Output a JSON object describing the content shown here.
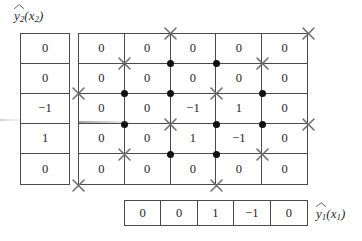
{
  "figure": {
    "type": "lattice-grid-diagram",
    "background_color": "#ffffff",
    "line_color": "#4a4a4a",
    "dot_color": "#111111",
    "cross_color": "#6b6b6b"
  },
  "labels": {
    "y2": {
      "base": "y",
      "sub": "2",
      "arg_open": "(",
      "arg_base": "x",
      "arg_sub": "2",
      "arg_close": ")",
      "full": "y2(x2)"
    },
    "y1": {
      "base": "y",
      "sub": "1",
      "arg_open": "(",
      "arg_base": "x",
      "arg_sub": "1",
      "arg_close": ")",
      "full": "y1(x1)"
    }
  },
  "left_column": {
    "name": "y2-values",
    "values": [
      "0",
      "0",
      "−1",
      "1",
      "0"
    ]
  },
  "bottom_row": {
    "name": "y1-values",
    "values": [
      "0",
      "0",
      "1",
      "−1",
      "0"
    ]
  },
  "grid": {
    "rows": 5,
    "cols": 5,
    "values": [
      [
        "0",
        "0",
        "0",
        "0",
        "0"
      ],
      [
        "0",
        "0",
        "0",
        "0",
        "0"
      ],
      [
        "0",
        "0",
        "−1",
        "1",
        "0"
      ],
      [
        "0",
        "0",
        "1",
        "−1",
        "0"
      ],
      [
        "0",
        "0",
        "0",
        "0",
        "0"
      ]
    ]
  },
  "markers": {
    "legend": {
      "dot": "●",
      "cross": "✕"
    },
    "points": [
      {
        "row": 0,
        "col": 2,
        "kind": "cross"
      },
      {
        "row": 0,
        "col": 5,
        "kind": "cross"
      },
      {
        "row": 1,
        "col": 1,
        "kind": "cross"
      },
      {
        "row": 1,
        "col": 2,
        "kind": "dot"
      },
      {
        "row": 1,
        "col": 3,
        "kind": "dot"
      },
      {
        "row": 1,
        "col": 4,
        "kind": "cross"
      },
      {
        "row": 2,
        "col": 0,
        "kind": "cross"
      },
      {
        "row": 2,
        "col": 1,
        "kind": "dot"
      },
      {
        "row": 2,
        "col": 2,
        "kind": "dot"
      },
      {
        "row": 2,
        "col": 3,
        "kind": "cross"
      },
      {
        "row": 2,
        "col": 4,
        "kind": "dot"
      },
      {
        "row": 3,
        "col": 1,
        "kind": "dot"
      },
      {
        "row": 3,
        "col": 2,
        "kind": "cross"
      },
      {
        "row": 3,
        "col": 3,
        "kind": "dot"
      },
      {
        "row": 3,
        "col": 4,
        "kind": "dot"
      },
      {
        "row": 3,
        "col": 5,
        "kind": "cross"
      },
      {
        "row": 4,
        "col": 1,
        "kind": "cross"
      },
      {
        "row": 4,
        "col": 2,
        "kind": "dot"
      },
      {
        "row": 4,
        "col": 3,
        "kind": "dot"
      },
      {
        "row": 4,
        "col": 4,
        "kind": "cross"
      },
      {
        "row": 5,
        "col": 0,
        "kind": "cross"
      },
      {
        "row": 5,
        "col": 3,
        "kind": "cross"
      }
    ]
  }
}
